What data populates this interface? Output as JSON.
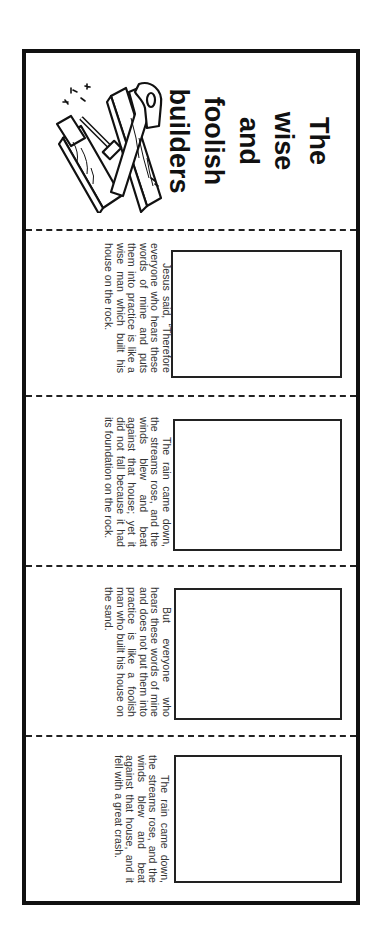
{
  "booklet": {
    "title_lines": [
      "The",
      "wise",
      "and",
      "foolish",
      "builders"
    ],
    "illustration": "tools-and-planks-illustration",
    "panels": [
      {
        "text": "Jesus said, “Therefore everyone who hears these words of mine and puts them into practice is like a wise man which built his house on the rock.",
        "drawing_box": "empty"
      },
      {
        "text": "The rain came down, the streams rose, and the winds blew and beat against that house; yet it did not fall because it had its foundation on the rock.",
        "drawing_box": "empty"
      },
      {
        "text": "But everyone who hears these words of mine and does not put them into practice is like a foolish man who built his house on the sand.",
        "drawing_box": "empty"
      },
      {
        "text": "The rain came down, the streams rose, and the winds blew and beat against that house, and it fell with a great crash.",
        "drawing_box": "empty"
      }
    ]
  }
}
